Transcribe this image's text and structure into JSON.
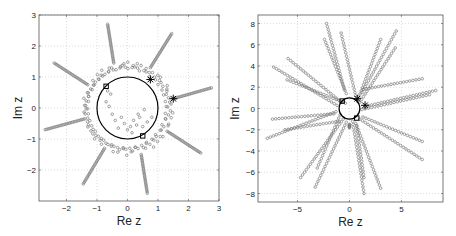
{
  "chart_data": [
    {
      "type": "scatter",
      "title": "",
      "xlabel": "Re z",
      "ylabel": "Im z",
      "xlim": [
        -2.9,
        3
      ],
      "ylim": [
        -3,
        3
      ],
      "xticks": [
        -2,
        -1,
        0,
        1,
        2,
        3
      ],
      "yticks": [
        -2,
        -1,
        0,
        1,
        2,
        3
      ],
      "grid": true,
      "box": {
        "x0": 39,
        "y0": 15,
        "x1": 219,
        "y1": 201
      },
      "circle": {
        "center": [
          0,
          0
        ],
        "radius": 1
      },
      "square_markers": [
        [
          -0.7,
          0.7
        ],
        [
          0.5,
          -0.9
        ]
      ],
      "star_markers": [
        [
          0.75,
          0.92
        ],
        [
          1.5,
          0.3
        ]
      ],
      "spikes": [
        {
          "base": [
            -0.45,
            1.45
          ],
          "tip": [
            -0.65,
            2.7
          ]
        },
        {
          "base": [
            0.75,
            1.3
          ],
          "tip": [
            1.45,
            2.4
          ]
        },
        {
          "base": [
            1.5,
            0.3
          ],
          "tip": [
            2.75,
            0.65
          ]
        },
        {
          "base": [
            1.3,
            -0.75
          ],
          "tip": [
            2.4,
            -1.45
          ]
        },
        {
          "base": [
            0.45,
            -1.5
          ],
          "tip": [
            0.65,
            -2.75
          ]
        },
        {
          "base": [
            -0.75,
            -1.3
          ],
          "tip": [
            -1.45,
            -2.45
          ]
        },
        {
          "base": [
            -1.4,
            -0.35
          ],
          "tip": [
            -2.7,
            -0.7
          ]
        },
        {
          "base": [
            -1.3,
            0.75
          ],
          "tip": [
            -2.4,
            1.45
          ]
        }
      ]
    },
    {
      "type": "scatter",
      "title": "",
      "xlabel": "Re z",
      "ylabel": "Im z",
      "xlim": [
        -8.8,
        9
      ],
      "ylim": [
        -8.8,
        8.8
      ],
      "xticks": [
        -5,
        0,
        5
      ],
      "yticks": [
        -8,
        -6,
        -4,
        -2,
        0,
        2,
        4,
        6,
        8
      ],
      "grid": true,
      "box": {
        "x0": 258,
        "y0": 15,
        "x1": 443,
        "y1": 202
      },
      "circle": {
        "center": [
          0,
          0
        ],
        "radius": 1
      },
      "rays": [
        {
          "from": [
            -0.5,
            1.8
          ],
          "to": [
            -2.2,
            8.0
          ]
        },
        {
          "from": [
            -0.3,
            1.4
          ],
          "to": [
            -2.4,
            6.5
          ]
        },
        {
          "from": [
            0.6,
            1.2
          ],
          "to": [
            -0.8,
            7.1
          ]
        },
        {
          "from": [
            0.8,
            0.8
          ],
          "to": [
            3.0,
            6.5
          ]
        },
        {
          "from": [
            1.2,
            1.5
          ],
          "to": [
            4.5,
            7.3
          ]
        },
        {
          "from": [
            1.0,
            0.6
          ],
          "to": [
            4.4,
            5.7
          ]
        },
        {
          "from": [
            1.3,
            1.8
          ],
          "to": [
            7.0,
            2.8
          ]
        },
        {
          "from": [
            1.5,
            0.2
          ],
          "to": [
            8.3,
            1.7
          ]
        },
        {
          "from": [
            1.2,
            -0.1
          ],
          "to": [
            7.7,
            1.3
          ]
        },
        {
          "from": [
            1.3,
            -0.8
          ],
          "to": [
            7.0,
            -3.1
          ]
        },
        {
          "from": [
            1.0,
            -1.0
          ],
          "to": [
            7.0,
            -4.8
          ]
        },
        {
          "from": [
            0.6,
            -1.4
          ],
          "to": [
            3.0,
            -7.5
          ]
        },
        {
          "from": [
            0.3,
            -1.2
          ],
          "to": [
            1.4,
            -8.0
          ]
        },
        {
          "from": [
            0.7,
            -1.6
          ],
          "to": [
            1.4,
            -6.5
          ]
        },
        {
          "from": [
            -0.3,
            -1.3
          ],
          "to": [
            -3.3,
            -7.4
          ]
        },
        {
          "from": [
            -0.6,
            -1.0
          ],
          "to": [
            -4.7,
            -6.5
          ]
        },
        {
          "from": [
            -0.9,
            -0.6
          ],
          "to": [
            -3.1,
            -5.6
          ]
        },
        {
          "from": [
            -1.3,
            -0.3
          ],
          "to": [
            -7.9,
            -2.8
          ]
        },
        {
          "from": [
            -1.5,
            -0.5
          ],
          "to": [
            -7.4,
            -1.0
          ]
        },
        {
          "from": [
            -1.0,
            -1.2
          ],
          "to": [
            -6.2,
            -2.0
          ]
        },
        {
          "from": [
            -1.2,
            0.3
          ],
          "to": [
            -7.3,
            3.9
          ]
        },
        {
          "from": [
            -0.8,
            0.6
          ],
          "to": [
            -5.9,
            4.7
          ]
        },
        {
          "from": [
            -0.4,
            0.5
          ],
          "to": [
            -6.0,
            2.7
          ]
        },
        {
          "from": [
            0.0,
            -1.5
          ],
          "to": [
            0.0,
            -1.8
          ]
        }
      ],
      "square_markers": [
        [
          -0.7,
          0.7
        ],
        [
          0.7,
          -0.9
        ]
      ],
      "star_markers": [
        [
          0.75,
          0.92
        ],
        [
          1.5,
          0.3
        ]
      ]
    }
  ]
}
